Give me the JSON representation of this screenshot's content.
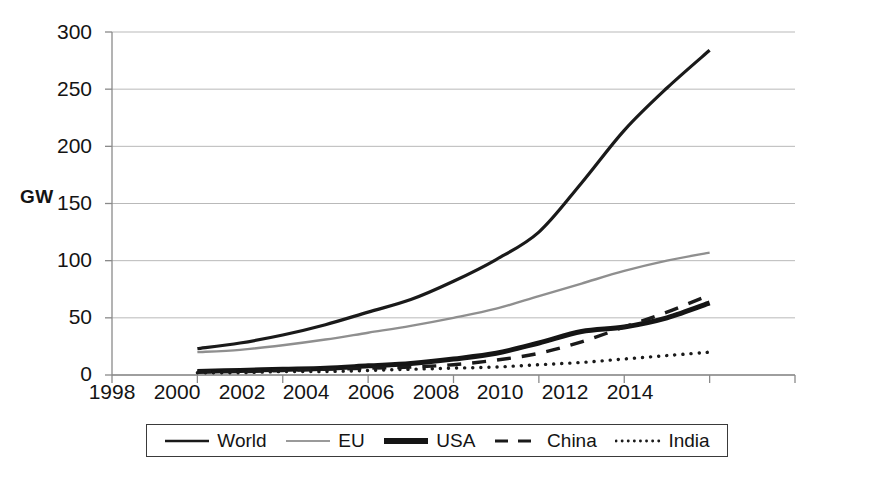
{
  "chart_data": {
    "type": "line",
    "title": "",
    "xlabel": "",
    "ylabel": "GW",
    "xlim": [
      1998,
      2014
    ],
    "ylim": [
      0,
      300
    ],
    "xticks": [
      "1998",
      "2000",
      "2002",
      "2004",
      "2006",
      "2008",
      "2010",
      "2012",
      "2014"
    ],
    "yticks": [
      "0",
      "50",
      "100",
      "150",
      "200",
      "250",
      "300"
    ],
    "grid": "horizontal",
    "legend_position": "bottom",
    "x": [
      2000,
      2001,
      2002,
      2003,
      2004,
      2005,
      2006,
      2007,
      2008,
      2009,
      2010,
      2011,
      2012
    ],
    "series": [
      {
        "name": "World",
        "style": "solid",
        "color": "#1a1a1a",
        "width": 3.2,
        "values": [
          23,
          28,
          35,
          44,
          55,
          66,
          82,
          101,
          125,
          168,
          214,
          251,
          284
        ]
      },
      {
        "name": "EU",
        "style": "solid",
        "color": "#8f8f8f",
        "width": 2.4,
        "values": [
          20,
          22,
          26,
          31,
          37,
          43,
          50,
          58,
          69,
          80,
          91,
          100,
          107
        ]
      },
      {
        "name": "USA",
        "style": "thick",
        "color": "#151515",
        "width": 5.0,
        "values": [
          3,
          4,
          5,
          6,
          8,
          10,
          14,
          19,
          28,
          38,
          42,
          50,
          63
        ]
      },
      {
        "name": "China",
        "style": "dashed",
        "color": "#1a1a1a",
        "width": 3.4,
        "values": [
          3,
          3,
          4,
          5,
          6,
          7,
          9,
          13,
          19,
          29,
          42,
          55,
          70
        ]
      },
      {
        "name": "India",
        "style": "dotted",
        "color": "#1a1a1a",
        "width": 3.4,
        "values": [
          2,
          2,
          3,
          3,
          4,
          5,
          6,
          7,
          9,
          11,
          14,
          17,
          20
        ]
      }
    ]
  },
  "axis": {
    "y_label": "GW",
    "y_ticks": [
      "300",
      "250",
      "200",
      "150",
      "100",
      "50",
      "0"
    ],
    "x_ticks": [
      "1998",
      "2000",
      "2002",
      "2004",
      "2006",
      "2008",
      "2010",
      "2012",
      "2014"
    ]
  },
  "legend": {
    "items": [
      {
        "label": "World",
        "style": "solid-thin",
        "color": "#1a1a1a"
      },
      {
        "label": "EU",
        "style": "solid-gray",
        "color": "#8f8f8f"
      },
      {
        "label": "USA",
        "style": "solid-thick",
        "color": "#151515"
      },
      {
        "label": "China",
        "style": "dashed",
        "color": "#1a1a1a"
      },
      {
        "label": "India",
        "style": "dotted",
        "color": "#1a1a1a"
      }
    ]
  },
  "colors": {
    "grid": "#b9b9b9",
    "axis": "#8a8a8a",
    "text": "#141414",
    "background": "#ffffff"
  }
}
